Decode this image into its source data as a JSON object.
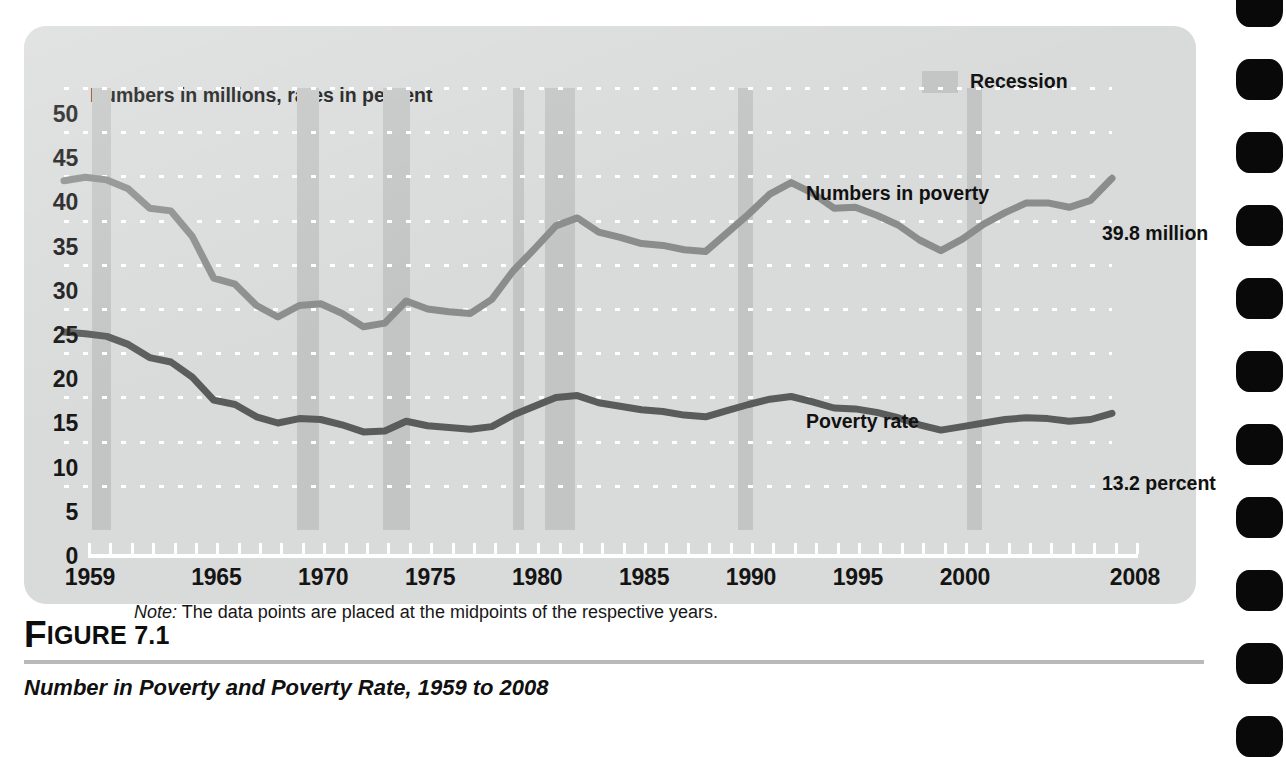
{
  "figure": {
    "number_prefix": "F",
    "number_rest": "IGURE 7.1",
    "caption": "Number in Poverty and Poverty Rate, 1959 to 2008"
  },
  "chart_panel": {
    "axis_note": "Numbers in millions, rates in percent",
    "source_note_prefix": "Note:",
    "source_note_text": " The data points are placed at the midpoints of the respective years.",
    "legend": {
      "label": "Recession",
      "swatch_color": "#c3c4c4"
    },
    "series_labels": {
      "numbers": "Numbers in poverty",
      "rate": "Poverty rate",
      "numbers_end": "39.8 million",
      "rate_end": "13.2 percent"
    }
  },
  "colors": {
    "panel_background": "#d9dada",
    "recession_band": "#c3c4c4",
    "gridline": "#ffffff",
    "axis": "#ffffff",
    "numbers_line": "#8b8c8c",
    "rate_line": "#5a5b5b",
    "text": "#111111",
    "binding_hole": "#090909",
    "figure_rule": "#b9baba"
  },
  "chart_data": {
    "type": "line",
    "title": "Number in Poverty and Poverty Rate, 1959 to 2008",
    "subtitle": "Numbers in millions, rates in percent",
    "xlabel": "",
    "ylabel": "Numbers in millions, rates in percent",
    "xlim": [
      1959,
      2008
    ],
    "ylim": [
      0,
      50
    ],
    "ytick_step": 5,
    "yticks": [
      0,
      5,
      10,
      15,
      20,
      25,
      30,
      35,
      40,
      45,
      50
    ],
    "xtick_labels": [
      "1959",
      "1965",
      "1970",
      "1975",
      "1980",
      "1985",
      "1990",
      "1995",
      "2000",
      "2008"
    ],
    "xtick_label_values": [
      1959,
      1965,
      1970,
      1975,
      1980,
      1985,
      1990,
      1995,
      2000,
      2008
    ],
    "xticks_minor_every": 1,
    "grid": "horizontal dotted white",
    "legend_position": "top-right",
    "annotations": [
      {
        "text": "Numbers in poverty",
        "near_x": 1993,
        "near_y": 43
      },
      {
        "text": "Poverty rate",
        "near_x": 1993,
        "near_y": 18
      },
      {
        "text": "39.8 million",
        "at_x": 2008,
        "at_y": 39.8
      },
      {
        "text": "13.2 percent",
        "at_x": 2008,
        "at_y": 13.2
      }
    ],
    "x": [
      1959,
      1960,
      1961,
      1962,
      1963,
      1964,
      1965,
      1966,
      1967,
      1968,
      1969,
      1970,
      1971,
      1972,
      1973,
      1974,
      1975,
      1976,
      1977,
      1978,
      1979,
      1980,
      1981,
      1982,
      1983,
      1984,
      1985,
      1986,
      1987,
      1988,
      1989,
      1990,
      1991,
      1992,
      1993,
      1994,
      1995,
      1996,
      1997,
      1998,
      1999,
      2000,
      2001,
      2002,
      2003,
      2004,
      2005,
      2006,
      2007,
      2008
    ],
    "series": [
      {
        "name": "Numbers in poverty",
        "unit": "millions",
        "color": "#8b8c8c",
        "final_value": 39.8,
        "values": [
          39.5,
          39.9,
          39.6,
          38.6,
          36.4,
          36.1,
          33.2,
          28.5,
          27.8,
          25.4,
          24.1,
          25.4,
          25.6,
          24.5,
          23.0,
          23.4,
          25.9,
          25.0,
          24.7,
          24.5,
          26.1,
          29.3,
          31.8,
          34.4,
          35.3,
          33.7,
          33.1,
          32.4,
          32.2,
          31.7,
          31.5,
          33.6,
          35.7,
          38.0,
          39.3,
          38.1,
          36.4,
          36.5,
          35.6,
          34.5,
          32.8,
          31.6,
          32.9,
          34.6,
          35.9,
          37.0,
          37.0,
          36.5,
          37.3,
          39.8
        ]
      },
      {
        "name": "Poverty rate",
        "unit": "percent",
        "color": "#5a5b5b",
        "final_value": 13.2,
        "values": [
          22.4,
          22.2,
          21.9,
          21.0,
          19.5,
          19.0,
          17.3,
          14.7,
          14.2,
          12.8,
          12.1,
          12.6,
          12.5,
          11.9,
          11.1,
          11.2,
          12.3,
          11.8,
          11.6,
          11.4,
          11.7,
          13.0,
          14.0,
          15.0,
          15.2,
          14.4,
          14.0,
          13.6,
          13.4,
          13.0,
          12.8,
          13.5,
          14.2,
          14.8,
          15.1,
          14.5,
          13.8,
          13.7,
          13.3,
          12.7,
          11.9,
          11.3,
          11.7,
          12.1,
          12.5,
          12.7,
          12.6,
          12.3,
          12.5,
          13.2
        ]
      }
    ],
    "recession_bands": [
      {
        "start": 1960.3,
        "end": 1961.2
      },
      {
        "start": 1969.9,
        "end": 1970.9
      },
      {
        "start": 1973.9,
        "end": 1975.2
      },
      {
        "start": 1980.0,
        "end": 1980.5
      },
      {
        "start": 1981.5,
        "end": 1982.9
      },
      {
        "start": 1990.5,
        "end": 1991.2
      },
      {
        "start": 2001.2,
        "end": 2001.9
      }
    ]
  }
}
